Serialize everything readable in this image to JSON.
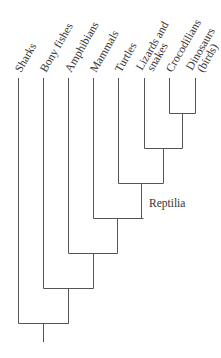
{
  "diagram": {
    "type": "cladogram",
    "taxa": [
      {
        "label": "Sharks",
        "x": 18
      },
      {
        "label": "Bony fishes",
        "x": 43
      },
      {
        "label": "Amphibians",
        "x": 68
      },
      {
        "label": "Mammals",
        "x": 93
      },
      {
        "label": "Turtles",
        "x": 118
      },
      {
        "label": "Lizards and",
        "label2": "snakes",
        "x": 144
      },
      {
        "label": "Crocodilians",
        "x": 169
      },
      {
        "label": "Dinosaurs",
        "label2": "(birds)",
        "x": 195
      }
    ],
    "clade_labels": [
      {
        "label": "Reptilia"
      }
    ]
  }
}
